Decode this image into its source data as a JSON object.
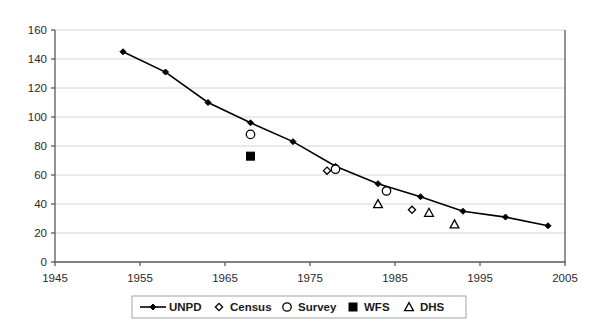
{
  "chart_data": {
    "type": "line",
    "title": "",
    "xlabel": "",
    "ylabel": "",
    "xlim": [
      1945,
      2005
    ],
    "ylim": [
      0,
      160
    ],
    "xticks": [
      1945,
      1955,
      1965,
      1975,
      1985,
      1995,
      2005
    ],
    "yticks": [
      0,
      20,
      40,
      60,
      80,
      100,
      120,
      140,
      160
    ],
    "grid": "horizontal",
    "legend_position": "bottom",
    "series": [
      {
        "name": "UNPD",
        "marker": "line-with-diamond",
        "style": "line",
        "points": [
          {
            "x": 1953,
            "y": 145
          },
          {
            "x": 1958,
            "y": 131
          },
          {
            "x": 1963,
            "y": 110
          },
          {
            "x": 1968,
            "y": 96
          },
          {
            "x": 1973,
            "y": 83
          },
          {
            "x": 1978,
            "y": 66
          },
          {
            "x": 1983,
            "y": 54
          },
          {
            "x": 1988,
            "y": 45
          },
          {
            "x": 1993,
            "y": 35
          },
          {
            "x": 1998,
            "y": 31
          },
          {
            "x": 2003,
            "y": 25
          }
        ]
      },
      {
        "name": "Census",
        "marker": "open-diamond",
        "style": "scatter",
        "points": [
          {
            "x": 1977,
            "y": 63
          },
          {
            "x": 1987,
            "y": 36
          }
        ]
      },
      {
        "name": "Survey",
        "marker": "open-circle",
        "style": "scatter",
        "points": [
          {
            "x": 1968,
            "y": 88
          },
          {
            "x": 1978,
            "y": 64
          },
          {
            "x": 1984,
            "y": 49
          }
        ]
      },
      {
        "name": "WFS",
        "marker": "filled-square",
        "style": "scatter",
        "points": [
          {
            "x": 1968,
            "y": 73
          }
        ]
      },
      {
        "name": "DHS",
        "marker": "open-triangle",
        "style": "scatter",
        "points": [
          {
            "x": 1983,
            "y": 40
          },
          {
            "x": 1989,
            "y": 34
          },
          {
            "x": 1992,
            "y": 26
          }
        ]
      }
    ]
  },
  "legend": {
    "entries": [
      {
        "label": "UNPD",
        "marker": "line-with-diamond"
      },
      {
        "label": "Census",
        "marker": "open-diamond"
      },
      {
        "label": "Survey",
        "marker": "open-circle"
      },
      {
        "label": "WFS",
        "marker": "filled-square"
      },
      {
        "label": "DHS",
        "marker": "open-triangle"
      }
    ]
  },
  "colors": {
    "series": "#000000",
    "grid": "#c9c9c9",
    "axis": "#5a5a5a",
    "background": "#ffffff"
  }
}
